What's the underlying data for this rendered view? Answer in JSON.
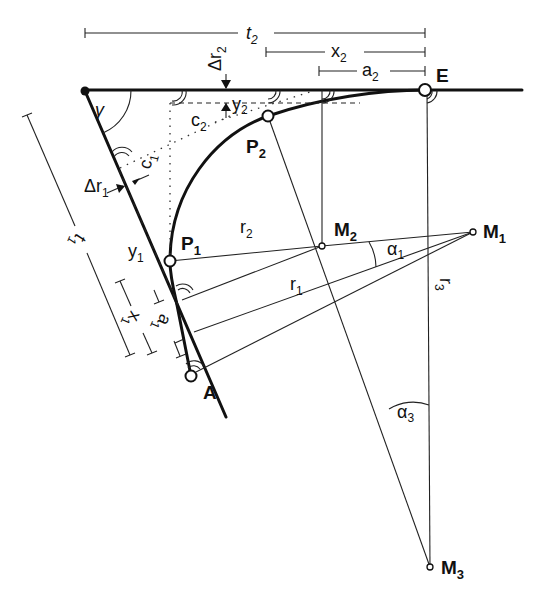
{
  "diagram": {
    "points": {
      "A": {
        "label": "A"
      },
      "E": {
        "label": "E"
      },
      "P1": {
        "label": "P",
        "sub": "1"
      },
      "P2": {
        "label": "P",
        "sub": "2"
      },
      "M1": {
        "label": "M",
        "sub": "1"
      },
      "M2": {
        "label": "M",
        "sub": "2"
      },
      "M3": {
        "label": "M",
        "sub": "3"
      }
    },
    "dimensions": {
      "t1": {
        "label": "t",
        "sub": "1"
      },
      "t2": {
        "label": "t",
        "sub": "2"
      },
      "x1": {
        "label": "x",
        "sub": "1"
      },
      "x2": {
        "label": "x",
        "sub": "2"
      },
      "a1": {
        "label": "a",
        "sub": "1"
      },
      "a2": {
        "label": "a",
        "sub": "2"
      },
      "y1": {
        "label": "y",
        "sub": "1"
      },
      "y2": {
        "label": "y",
        "sub": "2"
      },
      "c1": {
        "label": "c",
        "sub": "1"
      },
      "c2": {
        "label": "c",
        "sub": "2"
      },
      "dr1": {
        "label": "Δr",
        "sub": "1"
      },
      "dr2": {
        "label": "Δr",
        "sub": "2"
      }
    },
    "radii": {
      "r1": {
        "label": "r",
        "sub": "1"
      },
      "r2": {
        "label": "r",
        "sub": "2"
      },
      "r3": {
        "label": "r",
        "sub": "3"
      }
    },
    "angles": {
      "gamma": {
        "label": "γ"
      },
      "alpha1": {
        "label": "α",
        "sub": "1"
      },
      "alpha3": {
        "label": "α",
        "sub": "3"
      }
    }
  }
}
